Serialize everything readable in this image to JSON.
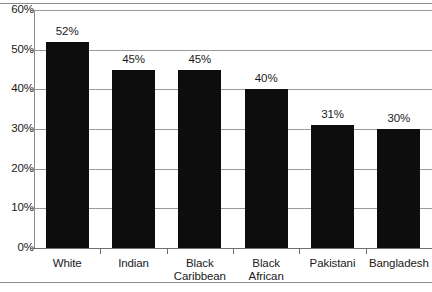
{
  "chart_data": {
    "type": "bar",
    "title": "",
    "subtitle": "",
    "xlabel": "",
    "ylabel": "",
    "categories": [
      "White",
      "Indian",
      "Black Caribbean",
      "Black African",
      "Pakistani",
      "Bangladesh"
    ],
    "category_lines": [
      [
        "White"
      ],
      [
        "Indian"
      ],
      [
        "Black",
        "Caribbean"
      ],
      [
        "Black",
        "African"
      ],
      [
        "Pakistani"
      ],
      [
        "Bangladesh"
      ]
    ],
    "values": [
      52,
      45,
      45,
      40,
      31,
      30
    ],
    "value_labels": [
      "52%",
      "45%",
      "45%",
      "40%",
      "31%",
      "30%"
    ],
    "ylim": [
      0,
      60
    ],
    "ytick_values": [
      0,
      10,
      20,
      30,
      40,
      50,
      60
    ],
    "ytick_labels": [
      "0%",
      "10%",
      "20%",
      "30%",
      "40%",
      "50%",
      "60%"
    ],
    "grid": true,
    "legend": "none",
    "bar_color": "#0d0d0d",
    "gridline_color": "#9a9a9a",
    "axis_color": "#6f6f6f",
    "background_color": "#ffffff"
  }
}
